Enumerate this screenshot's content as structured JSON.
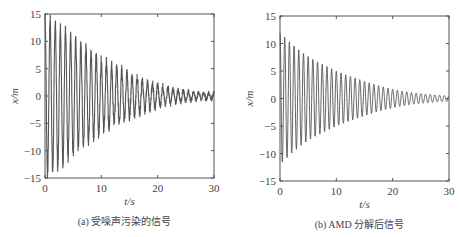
{
  "chart_data": [
    {
      "type": "line",
      "panel": "a",
      "caption": "(a) 受噪声污染的信号",
      "xlabel": "t/s",
      "ylabel": "x/m",
      "xlim": [
        0,
        30
      ],
      "ylim": [
        -15,
        15
      ],
      "xticks": [
        0,
        10,
        20,
        30
      ],
      "yticks": [
        15,
        10,
        5,
        0,
        -5,
        -10,
        -15
      ],
      "grid": false,
      "legend": null,
      "series": [
        {
          "name": "noisy signal",
          "description": "Exponentially decaying oscillation contaminated with noise",
          "frequency_hz": 1.1,
          "initial_amplitude": 14.5,
          "final_amplitude": 0.5,
          "noise": true,
          "x": [
            0,
            2,
            4,
            6,
            8,
            10,
            12,
            14,
            16,
            18,
            20,
            22,
            24,
            26,
            28,
            30
          ],
          "envelope": [
            14.5,
            13.5,
            11.5,
            9.5,
            8,
            6.5,
            5.5,
            4.5,
            3.5,
            2.5,
            2,
            1.5,
            1,
            0.8,
            0.6,
            0.5
          ]
        }
      ],
      "color": "#555555"
    },
    {
      "type": "line",
      "panel": "b",
      "caption": "(b) AMD 分解后信号",
      "xlabel": "t/s",
      "ylabel": "x/m",
      "xlim": [
        0,
        30
      ],
      "ylim": [
        -15,
        15
      ],
      "xticks": [
        0,
        10,
        20,
        30
      ],
      "yticks": [
        15,
        10,
        5,
        0,
        -5,
        -10,
        -15
      ],
      "grid": false,
      "legend": null,
      "series": [
        {
          "name": "AMD decomposed signal",
          "description": "Clean exponentially decaying oscillation after AMD decomposition",
          "frequency_hz": 1.2,
          "initial_amplitude": 12,
          "final_amplitude": 0.5,
          "noise": false,
          "x": [
            0,
            2,
            4,
            6,
            8,
            10,
            12,
            14,
            16,
            18,
            20,
            22,
            24,
            26,
            28,
            30
          ],
          "envelope": [
            12,
            10,
            8.3,
            7,
            6,
            5,
            4.2,
            3.5,
            2.8,
            2.2,
            1.7,
            1.3,
            1,
            0.8,
            0.6,
            0.5
          ]
        }
      ],
      "color": "#555555"
    }
  ],
  "panels": {
    "a": {
      "caption": "(a) 受噪声污染的信号",
      "xlabel": "t/s",
      "ylabel": "x/m"
    },
    "b": {
      "caption": "(b) AMD 分解后信号",
      "xlabel": "t/s",
      "ylabel": "x/m"
    }
  }
}
